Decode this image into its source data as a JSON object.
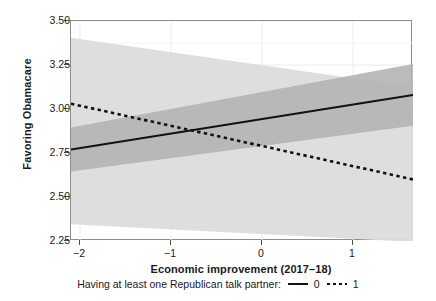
{
  "chart_data": {
    "type": "line",
    "title": "",
    "xlabel": "Economic improvement (2017–18)",
    "ylabel": "Favoring Obamacare",
    "xlim": [
      -2.0,
      1.75
    ],
    "ylim": [
      2.25,
      3.5
    ],
    "xticks": [
      -2,
      -1,
      0,
      1
    ],
    "xtick_labels": [
      "−2",
      "−1",
      "0",
      "1"
    ],
    "yticks": [
      2.25,
      2.5,
      2.75,
      3.0,
      3.25,
      3.5
    ],
    "ytick_labels": [
      "2.25",
      "2.50",
      "2.75",
      "3.00",
      "3.25",
      "3.50"
    ],
    "grid": true,
    "legend_position": "bottom",
    "legend_title": "Having at least one Republican talk partner:",
    "series": [
      {
        "name": "0",
        "style": "solid",
        "color": "#111111",
        "x": [
          -2.0,
          1.75
        ],
        "y": [
          2.77,
          3.08
        ],
        "band_color": "#b4b4b4",
        "band_lower": [
          2.645,
          2.905
        ],
        "band_upper": [
          2.895,
          3.255
        ]
      },
      {
        "name": "1",
        "style": "dotted",
        "color": "#111111",
        "x": [
          -2.0,
          1.75
        ],
        "y": [
          3.03,
          2.6
        ],
        "band_color": "#dcdcdc",
        "band_lower": [
          2.345,
          2.245
        ],
        "band_upper": [
          3.405,
          3.125
        ]
      }
    ],
    "annotations": []
  },
  "axes": {
    "y_title": "Favoring Obamacare",
    "x_title": "Economic improvement (2017–18)",
    "y_labels": [
      "3.50",
      "3.25",
      "3.00",
      "2.75",
      "2.50",
      "2.25"
    ],
    "x_labels": [
      "−2",
      "−1",
      "0",
      "1"
    ]
  },
  "legend": {
    "title": "Having at least one Republican talk partner:",
    "entries": [
      {
        "label": "0",
        "style": "solid"
      },
      {
        "label": "1",
        "style": "dotted"
      }
    ]
  },
  "colors": {
    "line": "#111111",
    "band_dark": "#b4b4b4",
    "band_light": "#dcdcdc",
    "grid": "#ebebeb",
    "panel_border": "#8c8c8c",
    "text": "#1a1a1a"
  }
}
